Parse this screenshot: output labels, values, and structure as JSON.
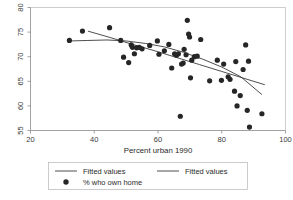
{
  "chart_data": {
    "type": "scatter",
    "title": "",
    "xlabel": "Percent urban 1990",
    "ylabel": "",
    "xlim": [
      20,
      100
    ],
    "ylim": [
      55,
      80
    ],
    "xticks": [
      20,
      40,
      60,
      80,
      100
    ],
    "yticks": [
      55,
      60,
      65,
      70,
      75,
      80
    ],
    "grid": false,
    "legend_position": "below-plot",
    "series": [
      {
        "name": "% who own home",
        "type": "scatter",
        "marker": "filled-circle",
        "color": "#262626",
        "points": [
          [
            32.2,
            73.3
          ],
          [
            36.3,
            75.2
          ],
          [
            44.8,
            75.9
          ],
          [
            48.3,
            73.3
          ],
          [
            49.2,
            69.9
          ],
          [
            50.8,
            68.8
          ],
          [
            51.6,
            72.4
          ],
          [
            52.0,
            71.9
          ],
          [
            52.6,
            70.6
          ],
          [
            53.3,
            71.8
          ],
          [
            54.1,
            71.9
          ],
          [
            55.0,
            71.6
          ],
          [
            57.4,
            72.3
          ],
          [
            59.8,
            73.2
          ],
          [
            60.3,
            70.5
          ],
          [
            62.0,
            71.2
          ],
          [
            63.4,
            72.5
          ],
          [
            64.3,
            67.7
          ],
          [
            65.2,
            70.6
          ],
          [
            65.8,
            70.3
          ],
          [
            66.4,
            70.6
          ],
          [
            67.0,
            57.9
          ],
          [
            67.4,
            68.5
          ],
          [
            67.9,
            68.7
          ],
          [
            68.2,
            71.5
          ],
          [
            68.8,
            70.4
          ],
          [
            69.2,
            77.4
          ],
          [
            69.6,
            74.6
          ],
          [
            69.9,
            74.0
          ],
          [
            70.2,
            65.7
          ],
          [
            70.6,
            69.3
          ],
          [
            71.4,
            70.0
          ],
          [
            72.3,
            70.1
          ],
          [
            73.4,
            73.5
          ],
          [
            76.2,
            65.1
          ],
          [
            78.6,
            69.3
          ],
          [
            79.9,
            65.2
          ],
          [
            80.6,
            68.5
          ],
          [
            82.0,
            65.9
          ],
          [
            82.6,
            65.4
          ],
          [
            84.0,
            63.0
          ],
          [
            84.4,
            69.0
          ],
          [
            84.8,
            60.0
          ],
          [
            85.8,
            62.1
          ],
          [
            86.7,
            67.4
          ],
          [
            87.5,
            72.4
          ],
          [
            88.0,
            59.1
          ],
          [
            88.4,
            69.1
          ],
          [
            88.7,
            55.7
          ],
          [
            92.6,
            58.4
          ]
        ]
      },
      {
        "name": "Fitted values",
        "type": "line",
        "color": "#2f2f2f",
        "points": [
          [
            38.0,
            75.2
          ],
          [
            45.0,
            73.9
          ],
          [
            52.0,
            72.5
          ],
          [
            59.0,
            71.2
          ],
          [
            66.0,
            69.8
          ],
          [
            73.0,
            68.4
          ],
          [
            80.0,
            67.0
          ],
          [
            87.0,
            65.6
          ],
          [
            93.5,
            64.3
          ]
        ]
      },
      {
        "name": "Fitted values",
        "type": "line",
        "color": "#2f2f2f",
        "points": [
          [
            32.2,
            73.2
          ],
          [
            38.0,
            73.3
          ],
          [
            44.0,
            73.4
          ],
          [
            50.0,
            73.2
          ],
          [
            56.0,
            72.7
          ],
          [
            62.0,
            72.0
          ],
          [
            68.0,
            70.9
          ],
          [
            74.0,
            69.5
          ],
          [
            80.0,
            67.9
          ],
          [
            86.0,
            65.9
          ],
          [
            92.6,
            62.3
          ]
        ]
      }
    ],
    "legend_entries": [
      {
        "label": "Fitted values",
        "marker": "line"
      },
      {
        "label": "Fitted values",
        "marker": "line"
      },
      {
        "label": "% who own home",
        "marker": "filled-circle"
      }
    ]
  }
}
